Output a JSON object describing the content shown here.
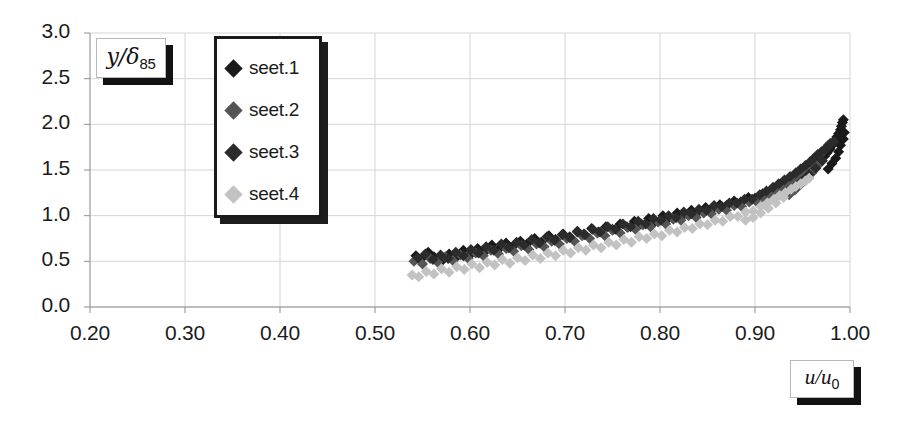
{
  "chart_data": {
    "type": "scatter",
    "title": "",
    "xlabel": "u/u0",
    "ylabel": "y/d85",
    "xlabel_display": "u/u",
    "xlabel_sub": "0",
    "ylabel_display": "y/δ",
    "ylabel_sub": "85",
    "xlim": [
      0.2,
      1.0
    ],
    "ylim": [
      0.0,
      3.0
    ],
    "xticks": [
      "0.20",
      "0.30",
      "0.40",
      "0.50",
      "0.60",
      "0.70",
      "0.80",
      "0.90",
      "1.00"
    ],
    "xtick_values": [
      0.2,
      0.3,
      0.4,
      0.5,
      0.6,
      0.7,
      0.8,
      0.9,
      1.0
    ],
    "yticks": [
      "0.0",
      "0.5",
      "1.0",
      "1.5",
      "2.0",
      "2.5",
      "3.0"
    ],
    "ytick_values": [
      0.0,
      0.5,
      1.0,
      1.5,
      2.0,
      2.5,
      3.0
    ],
    "grid": true,
    "legend_position": "top-left-inside",
    "marker": "diamond",
    "marker_size": 11,
    "series": [
      {
        "name": "seet.1",
        "color": "#1a1a1a",
        "points": [
          [
            0.543,
            0.56
          ],
          [
            0.548,
            0.52
          ],
          [
            0.556,
            0.6
          ],
          [
            0.562,
            0.55
          ],
          [
            0.57,
            0.5
          ],
          [
            0.578,
            0.58
          ],
          [
            0.585,
            0.54
          ],
          [
            0.593,
            0.62
          ],
          [
            0.6,
            0.57
          ],
          [
            0.608,
            0.64
          ],
          [
            0.615,
            0.6
          ],
          [
            0.623,
            0.68
          ],
          [
            0.63,
            0.63
          ],
          [
            0.638,
            0.7
          ],
          [
            0.645,
            0.66
          ],
          [
            0.653,
            0.72
          ],
          [
            0.66,
            0.69
          ],
          [
            0.668,
            0.75
          ],
          [
            0.675,
            0.71
          ],
          [
            0.683,
            0.78
          ],
          [
            0.69,
            0.74
          ],
          [
            0.698,
            0.8
          ],
          [
            0.705,
            0.77
          ],
          [
            0.713,
            0.83
          ],
          [
            0.72,
            0.8
          ],
          [
            0.728,
            0.86
          ],
          [
            0.735,
            0.82
          ],
          [
            0.743,
            0.88
          ],
          [
            0.75,
            0.85
          ],
          [
            0.758,
            0.91
          ],
          [
            0.765,
            0.88
          ],
          [
            0.773,
            0.94
          ],
          [
            0.78,
            0.91
          ],
          [
            0.788,
            0.97
          ],
          [
            0.795,
            0.94
          ],
          [
            0.803,
            1.0
          ],
          [
            0.81,
            0.98
          ],
          [
            0.818,
            1.03
          ],
          [
            0.825,
            1.01
          ],
          [
            0.833,
            1.06
          ],
          [
            0.84,
            1.04
          ],
          [
            0.848,
            1.09
          ],
          [
            0.855,
            1.07
          ],
          [
            0.863,
            1.12
          ],
          [
            0.87,
            1.11
          ],
          [
            0.878,
            1.16
          ],
          [
            0.885,
            1.15
          ],
          [
            0.893,
            1.2
          ],
          [
            0.9,
            1.19
          ],
          [
            0.908,
            1.24
          ],
          [
            0.915,
            1.24
          ],
          [
            0.921,
            1.28
          ],
          [
            0.928,
            1.31
          ],
          [
            0.934,
            1.34
          ],
          [
            0.94,
            1.38
          ],
          [
            0.946,
            1.42
          ],
          [
            0.951,
            1.45
          ],
          [
            0.956,
            1.49
          ],
          [
            0.961,
            1.53
          ],
          [
            0.965,
            1.57
          ],
          [
            0.969,
            1.61
          ],
          [
            0.973,
            1.65
          ],
          [
            0.976,
            1.69
          ],
          [
            0.979,
            1.73
          ],
          [
            0.982,
            1.78
          ],
          [
            0.984,
            1.82
          ],
          [
            0.986,
            1.86
          ],
          [
            0.988,
            1.9
          ],
          [
            0.99,
            1.94
          ],
          [
            0.991,
            1.98
          ],
          [
            0.992,
            2.02
          ],
          [
            0.993,
            2.05
          ],
          [
            0.988,
            1.7
          ],
          [
            0.985,
            1.63
          ],
          [
            0.981,
            1.57
          ],
          [
            0.977,
            1.51
          ],
          [
            0.99,
            1.77
          ],
          [
            0.993,
            1.84
          ],
          [
            0.994,
            1.91
          ]
        ]
      },
      {
        "name": "seet.2",
        "color": "#555555",
        "points": [
          [
            0.541,
            0.5
          ],
          [
            0.55,
            0.47
          ],
          [
            0.558,
            0.53
          ],
          [
            0.566,
            0.49
          ],
          [
            0.574,
            0.55
          ],
          [
            0.582,
            0.51
          ],
          [
            0.59,
            0.57
          ],
          [
            0.598,
            0.53
          ],
          [
            0.606,
            0.59
          ],
          [
            0.614,
            0.56
          ],
          [
            0.622,
            0.62
          ],
          [
            0.63,
            0.58
          ],
          [
            0.638,
            0.64
          ],
          [
            0.646,
            0.61
          ],
          [
            0.654,
            0.67
          ],
          [
            0.662,
            0.63
          ],
          [
            0.67,
            0.69
          ],
          [
            0.678,
            0.66
          ],
          [
            0.686,
            0.72
          ],
          [
            0.694,
            0.69
          ],
          [
            0.702,
            0.75
          ],
          [
            0.71,
            0.72
          ],
          [
            0.718,
            0.78
          ],
          [
            0.726,
            0.75
          ],
          [
            0.734,
            0.81
          ],
          [
            0.742,
            0.78
          ],
          [
            0.75,
            0.84
          ],
          [
            0.758,
            0.81
          ],
          [
            0.766,
            0.87
          ],
          [
            0.774,
            0.85
          ],
          [
            0.782,
            0.9
          ],
          [
            0.79,
            0.88
          ],
          [
            0.798,
            0.93
          ],
          [
            0.806,
            0.91
          ],
          [
            0.814,
            0.96
          ],
          [
            0.822,
            0.95
          ],
          [
            0.83,
            1.0
          ],
          [
            0.838,
            0.98
          ],
          [
            0.846,
            1.03
          ],
          [
            0.854,
            1.02
          ],
          [
            0.862,
            1.07
          ],
          [
            0.87,
            1.06
          ],
          [
            0.878,
            1.11
          ],
          [
            0.886,
            1.1
          ],
          [
            0.894,
            1.15
          ],
          [
            0.902,
            1.15
          ],
          [
            0.909,
            1.2
          ],
          [
            0.916,
            1.24
          ],
          [
            0.922,
            1.28
          ],
          [
            0.928,
            1.32
          ],
          [
            0.934,
            1.36
          ],
          [
            0.939,
            1.4
          ],
          [
            0.944,
            1.44
          ],
          [
            0.949,
            1.48
          ],
          [
            0.954,
            1.52
          ],
          [
            0.958,
            1.56
          ],
          [
            0.962,
            1.6
          ],
          [
            0.966,
            1.64
          ],
          [
            0.969,
            1.68
          ],
          [
            0.972,
            1.71
          ],
          [
            0.975,
            1.74
          ],
          [
            0.977,
            1.77
          ],
          [
            0.979,
            1.79
          ],
          [
            0.966,
            1.55
          ],
          [
            0.96,
            1.47
          ],
          [
            0.954,
            1.4
          ],
          [
            0.948,
            1.34
          ],
          [
            0.942,
            1.28
          ],
          [
            0.936,
            1.23
          ]
        ]
      },
      {
        "name": "seet.3",
        "color": "#2b2b2b",
        "points": [
          [
            0.545,
            0.54
          ],
          [
            0.553,
            0.58
          ],
          [
            0.561,
            0.52
          ],
          [
            0.569,
            0.57
          ],
          [
            0.577,
            0.53
          ],
          [
            0.585,
            0.6
          ],
          [
            0.593,
            0.56
          ],
          [
            0.601,
            0.63
          ],
          [
            0.609,
            0.59
          ],
          [
            0.617,
            0.66
          ],
          [
            0.625,
            0.62
          ],
          [
            0.633,
            0.69
          ],
          [
            0.641,
            0.65
          ],
          [
            0.649,
            0.71
          ],
          [
            0.657,
            0.68
          ],
          [
            0.665,
            0.74
          ],
          [
            0.673,
            0.7
          ],
          [
            0.681,
            0.77
          ],
          [
            0.689,
            0.73
          ],
          [
            0.697,
            0.79
          ],
          [
            0.705,
            0.76
          ],
          [
            0.713,
            0.82
          ],
          [
            0.721,
            0.79
          ],
          [
            0.729,
            0.85
          ],
          [
            0.737,
            0.82
          ],
          [
            0.745,
            0.88
          ],
          [
            0.753,
            0.85
          ],
          [
            0.761,
            0.91
          ],
          [
            0.769,
            0.88
          ],
          [
            0.777,
            0.94
          ],
          [
            0.785,
            0.91
          ],
          [
            0.793,
            0.97
          ],
          [
            0.801,
            0.95
          ],
          [
            0.809,
            1.0
          ],
          [
            0.817,
            0.98
          ],
          [
            0.825,
            1.04
          ],
          [
            0.833,
            1.02
          ],
          [
            0.841,
            1.07
          ],
          [
            0.849,
            1.06
          ],
          [
            0.857,
            1.11
          ],
          [
            0.865,
            1.1
          ],
          [
            0.873,
            1.14
          ],
          [
            0.881,
            1.14
          ],
          [
            0.889,
            1.18
          ],
          [
            0.897,
            1.18
          ],
          [
            0.905,
            1.23
          ],
          [
            0.912,
            1.27
          ],
          [
            0.919,
            1.31
          ],
          [
            0.925,
            1.35
          ],
          [
            0.931,
            1.39
          ],
          [
            0.937,
            1.43
          ],
          [
            0.943,
            1.47
          ],
          [
            0.948,
            1.51
          ],
          [
            0.953,
            1.55
          ],
          [
            0.958,
            1.59
          ],
          [
            0.962,
            1.63
          ],
          [
            0.966,
            1.67
          ],
          [
            0.97,
            1.7
          ],
          [
            0.974,
            1.73
          ],
          [
            0.977,
            1.76
          ],
          [
            0.98,
            1.79
          ],
          [
            0.983,
            1.81
          ],
          [
            0.971,
            1.6
          ],
          [
            0.964,
            1.52
          ],
          [
            0.957,
            1.45
          ],
          [
            0.95,
            1.38
          ],
          [
            0.944,
            1.32
          ]
        ]
      },
      {
        "name": "seet.4",
        "color": "#c2c2c2",
        "points": [
          [
            0.539,
            0.35
          ],
          [
            0.546,
            0.33
          ],
          [
            0.554,
            0.39
          ],
          [
            0.562,
            0.36
          ],
          [
            0.57,
            0.42
          ],
          [
            0.578,
            0.38
          ],
          [
            0.586,
            0.44
          ],
          [
            0.594,
            0.41
          ],
          [
            0.602,
            0.47
          ],
          [
            0.61,
            0.43
          ],
          [
            0.618,
            0.49
          ],
          [
            0.626,
            0.46
          ],
          [
            0.634,
            0.52
          ],
          [
            0.642,
            0.48
          ],
          [
            0.65,
            0.54
          ],
          [
            0.658,
            0.51
          ],
          [
            0.666,
            0.57
          ],
          [
            0.674,
            0.53
          ],
          [
            0.682,
            0.59
          ],
          [
            0.69,
            0.56
          ],
          [
            0.698,
            0.62
          ],
          [
            0.706,
            0.59
          ],
          [
            0.714,
            0.65
          ],
          [
            0.722,
            0.62
          ],
          [
            0.73,
            0.68
          ],
          [
            0.738,
            0.65
          ],
          [
            0.746,
            0.71
          ],
          [
            0.754,
            0.68
          ],
          [
            0.762,
            0.74
          ],
          [
            0.77,
            0.71
          ],
          [
            0.778,
            0.77
          ],
          [
            0.786,
            0.75
          ],
          [
            0.794,
            0.8
          ],
          [
            0.802,
            0.78
          ],
          [
            0.81,
            0.84
          ],
          [
            0.818,
            0.82
          ],
          [
            0.826,
            0.87
          ],
          [
            0.834,
            0.86
          ],
          [
            0.842,
            0.91
          ],
          [
            0.85,
            0.9
          ],
          [
            0.858,
            0.95
          ],
          [
            0.866,
            0.94
          ],
          [
            0.874,
            0.99
          ],
          [
            0.882,
            0.99
          ],
          [
            0.89,
            1.04
          ],
          [
            0.898,
            1.05
          ],
          [
            0.906,
            1.1
          ],
          [
            0.913,
            1.14
          ],
          [
            0.92,
            1.18
          ],
          [
            0.926,
            1.22
          ],
          [
            0.932,
            1.25
          ],
          [
            0.938,
            1.29
          ],
          [
            0.943,
            1.32
          ],
          [
            0.948,
            1.35
          ],
          [
            0.953,
            1.38
          ],
          [
            0.957,
            1.41
          ],
          [
            0.93,
            1.2
          ],
          [
            0.922,
            1.14
          ],
          [
            0.914,
            1.08
          ],
          [
            0.906,
            1.03
          ],
          [
            0.898,
            0.98
          ],
          [
            0.89,
            0.95
          ]
        ]
      }
    ]
  },
  "legend": {
    "items": [
      {
        "label": "seet.1",
        "color": "#1a1a1a"
      },
      {
        "label": "seet.2",
        "color": "#555555"
      },
      {
        "label": "seet.3",
        "color": "#2b2b2b"
      },
      {
        "label": "seet.4",
        "color": "#c2c2c2"
      }
    ]
  }
}
